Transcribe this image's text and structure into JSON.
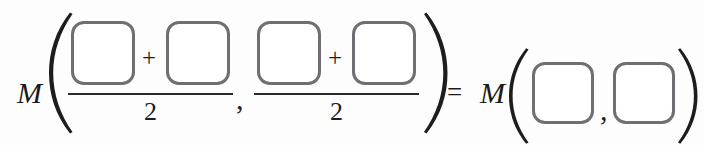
{
  "figure": {
    "kind": "mathematical-equation",
    "background_color": "#fdfdfd",
    "ink_color": "#1d1d1d",
    "box_border_color": "#6f6f73"
  },
  "equation": {
    "plain_text": "M(( □ + □ )/2, ( □ + □ )/2) = M(□, □)",
    "left_side": {
      "function_name": "M",
      "open_paren": "(",
      "close_paren": ")",
      "arguments": [
        {
          "numerator": {
            "first_box": "",
            "operator": "+",
            "second_box": ""
          },
          "denominator": "2"
        },
        {
          "numerator": {
            "first_box": "",
            "operator": "+",
            "second_box": ""
          },
          "denominator": "2"
        }
      ],
      "argument_separator": ","
    },
    "relation": "=",
    "right_side": {
      "function_name": "M",
      "open_paren": "(",
      "close_paren": ")",
      "arguments": [
        {
          "box": ""
        },
        {
          "box": ""
        }
      ],
      "argument_separator": ","
    }
  }
}
